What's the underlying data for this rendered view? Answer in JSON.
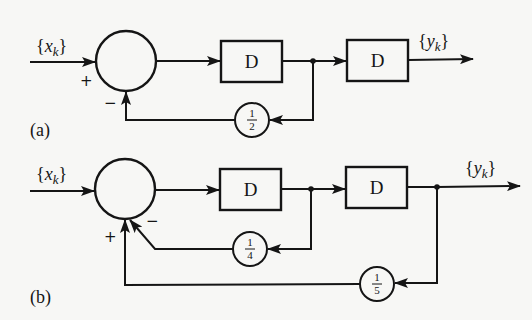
{
  "diagram": {
    "type": "block-diagram",
    "colors": {
      "ink": "#151515",
      "paper": "#f7f7f5"
    },
    "a": {
      "label": "(a)",
      "input": {
        "name": "x",
        "sub": "k"
      },
      "output": {
        "name": "y",
        "sub": "k"
      },
      "delays": [
        "D",
        "D"
      ],
      "sum_signs": {
        "input": "+",
        "feedback": "−"
      },
      "gains": [
        {
          "num": "1",
          "den": "2"
        }
      ]
    },
    "b": {
      "label": "(b)",
      "input": {
        "name": "x",
        "sub": "k"
      },
      "output": {
        "name": "y",
        "sub": "k"
      },
      "delays": [
        "D",
        "D"
      ],
      "sum_signs": {
        "outer": "+",
        "inner": "−"
      },
      "gains": [
        {
          "num": "1",
          "den": "4"
        },
        {
          "num": "1",
          "den": "5"
        }
      ]
    }
  }
}
